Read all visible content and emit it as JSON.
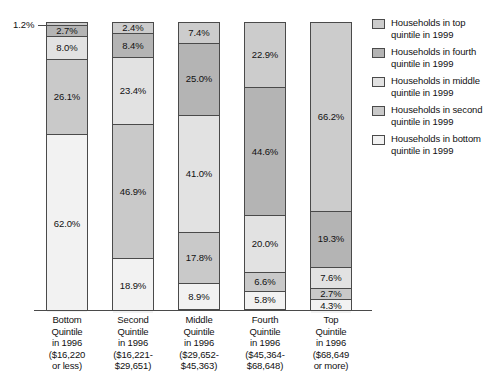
{
  "chart_data": {
    "type": "bar",
    "subtype": "100-percent-stacked-vertical",
    "title": "",
    "subtitle": "",
    "xlabel": "",
    "ylabel": "",
    "ylim": [
      0,
      100
    ],
    "grid": false,
    "legend_position": "right",
    "categories": [
      "Bottom Quintile in 1996 ($16,220 or less)",
      "Second Quintile in 1996 ($16,221-$29,651)",
      "Middle Quintile in 1996 ($29,652-$45,363)",
      "Fourth Quintile in 1996 ($45,364-$68,648)",
      "Top Quintile in 1996 ($68,649 or more)"
    ],
    "series": [
      {
        "name": "Households in bottom quintile in 1999",
        "stack_order": 0,
        "color": "#f2f2f2",
        "values": [
          62.0,
          18.9,
          8.9,
          5.8,
          4.3
        ]
      },
      {
        "name": "Households in second quintile in 1999",
        "stack_order": 1,
        "color": "#c9c9c9",
        "values": [
          26.1,
          46.9,
          17.8,
          6.6,
          2.7
        ]
      },
      {
        "name": "Households in middle quintile in 1999",
        "stack_order": 2,
        "color": "#e2e2e2",
        "values": [
          8.0,
          23.4,
          41.0,
          20.0,
          7.6
        ]
      },
      {
        "name": "Households in fourth quintile in 1999",
        "stack_order": 3,
        "color": "#b4b4b4",
        "values": [
          2.7,
          8.4,
          25.0,
          44.6,
          19.3
        ]
      },
      {
        "name": "Households in top quintile in 1999",
        "stack_order": 4,
        "color": "#cccccc",
        "values": [
          1.2,
          2.4,
          7.4,
          22.9,
          66.2
        ]
      }
    ],
    "annotations": [
      {
        "text": "1.2%",
        "refers_to": "Bottom Quintile 1996 / top quintile 1999 segment",
        "placement": "outside-left-with-leader-line"
      }
    ]
  },
  "bars": [
    {
      "key": "bottom-quintile",
      "label_lines": [
        "Bottom",
        "Quintile",
        "in 1996",
        "($16,220",
        "or less)"
      ],
      "segments": [
        {
          "label": "62.0%",
          "value": 62.0,
          "fill": "q0",
          "show_label": true
        },
        {
          "label": "26.1%",
          "value": 26.1,
          "fill": "q1",
          "show_label": true
        },
        {
          "label": "8.0%",
          "value": 8.0,
          "fill": "q2",
          "show_label": true
        },
        {
          "label": "2.7%",
          "value": 2.7,
          "fill": "q3",
          "show_label": true
        },
        {
          "label": "1.2%",
          "value": 1.2,
          "fill": "q4",
          "show_label": false
        }
      ]
    },
    {
      "key": "second-quintile",
      "label_lines": [
        "Second",
        "Quintile",
        "in 1996",
        "($16,221-",
        "$29,651)"
      ],
      "segments": [
        {
          "label": "18.9%",
          "value": 18.9,
          "fill": "q0",
          "show_label": true
        },
        {
          "label": "46.9%",
          "value": 46.9,
          "fill": "q1",
          "show_label": true
        },
        {
          "label": "23.4%",
          "value": 23.4,
          "fill": "q2",
          "show_label": true
        },
        {
          "label": "8.4%",
          "value": 8.4,
          "fill": "q3",
          "show_label": true
        },
        {
          "label": "2.4%",
          "value": 2.4,
          "fill": "q4",
          "show_label": true
        }
      ]
    },
    {
      "key": "middle-quintile",
      "label_lines": [
        "Middle",
        "Quintile",
        "in 1996",
        "($29,652-",
        "$45,363)"
      ],
      "segments": [
        {
          "label": "8.9%",
          "value": 8.9,
          "fill": "q0",
          "show_label": true
        },
        {
          "label": "17.8%",
          "value": 17.8,
          "fill": "q1",
          "show_label": true
        },
        {
          "label": "41.0%",
          "value": 41.0,
          "fill": "q2",
          "show_label": true
        },
        {
          "label": "25.0%",
          "value": 25.0,
          "fill": "q3",
          "show_label": true
        },
        {
          "label": "7.4%",
          "value": 7.4,
          "fill": "q4",
          "show_label": true
        }
      ]
    },
    {
      "key": "fourth-quintile",
      "label_lines": [
        "Fourth",
        "Quintile",
        "in 1996",
        "($45,364-",
        "$68,648)"
      ],
      "segments": [
        {
          "label": "5.8%",
          "value": 5.8,
          "fill": "q0",
          "show_label": true
        },
        {
          "label": "6.6%",
          "value": 6.6,
          "fill": "q1",
          "show_label": true
        },
        {
          "label": "20.0%",
          "value": 20.0,
          "fill": "q2",
          "show_label": true
        },
        {
          "label": "44.6%",
          "value": 44.6,
          "fill": "q3",
          "show_label": true
        },
        {
          "label": "22.9%",
          "value": 22.9,
          "fill": "q4",
          "show_label": true
        }
      ]
    },
    {
      "key": "top-quintile",
      "label_lines": [
        "Top",
        "Quintile",
        "in 1996",
        "($68,649",
        "or more)"
      ],
      "segments": [
        {
          "label": "4.3%",
          "value": 4.3,
          "fill": "q0",
          "show_label": true
        },
        {
          "label": "2.7%",
          "value": 2.7,
          "fill": "q1",
          "show_label": true
        },
        {
          "label": "7.6%",
          "value": 7.6,
          "fill": "q2",
          "show_label": true
        },
        {
          "label": "19.3%",
          "value": 19.3,
          "fill": "q3",
          "show_label": true
        },
        {
          "label": "66.2%",
          "value": 66.2,
          "fill": "q4",
          "show_label": true
        }
      ]
    }
  ],
  "callout": {
    "text": "1.2%"
  },
  "legend": {
    "items": [
      {
        "key": "top",
        "fill": "q4",
        "lines": [
          "Households in top",
          "quintile in 1999"
        ]
      },
      {
        "key": "fourth",
        "fill": "q3",
        "lines": [
          "Households in fourth",
          "quintile in 1999"
        ]
      },
      {
        "key": "middle",
        "fill": "q2",
        "lines": [
          "Households in middle",
          "quintile in 1999"
        ]
      },
      {
        "key": "second",
        "fill": "q1",
        "lines": [
          "Households in second",
          "quintile in 1999"
        ]
      },
      {
        "key": "bottom",
        "fill": "q0",
        "lines": [
          "Households in bottom",
          "quintile in 1999"
        ]
      }
    ]
  }
}
